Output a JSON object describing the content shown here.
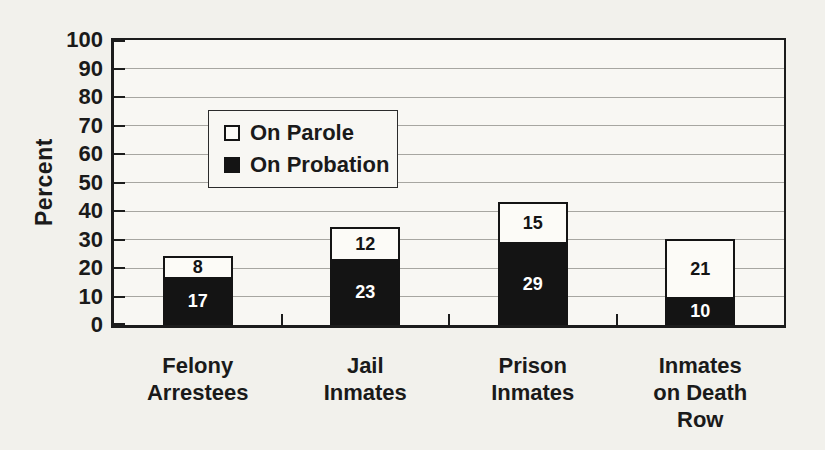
{
  "page": {
    "background": "#f2f1ec"
  },
  "chart_data": {
    "type": "bar",
    "stacked": true,
    "title": "",
    "xlabel": "",
    "ylabel": "Percent",
    "ylim": [
      0,
      100
    ],
    "yticks": [
      0,
      10,
      20,
      30,
      40,
      50,
      60,
      70,
      80,
      90,
      100
    ],
    "grid": true,
    "legend_position": "inside-upper-left",
    "categories": [
      "Felony Arrestees",
      "Jail Inmates",
      "Prison Inmates",
      "Inmates on Death Row"
    ],
    "category_label_lines": [
      [
        "Felony",
        "Arrestees"
      ],
      [
        "Jail",
        "Inmates"
      ],
      [
        "Prison",
        "Inmates"
      ],
      [
        "Inmates",
        "on Death",
        "Row"
      ]
    ],
    "stack_order_bottom_to_top": [
      "On Probation",
      "On Parole"
    ],
    "series": [
      {
        "name": "On Probation",
        "fill": "#141414",
        "label_color": "#ffffff",
        "values": [
          17,
          23,
          29,
          10
        ]
      },
      {
        "name": "On Parole",
        "fill": "#fcfbf7",
        "label_color": "#141414",
        "values": [
          8,
          12,
          15,
          21
        ]
      }
    ]
  },
  "legend": {
    "items": [
      {
        "label": "On Parole",
        "swatch": "white-square-icon"
      },
      {
        "label": "On Probation",
        "swatch": "black-square-icon"
      }
    ]
  },
  "colors": {
    "axis": "#1c1c1c",
    "grid": "#a7a6a1",
    "plot_background": "#f8f7f3",
    "page_background": "#f2f1ec",
    "bar_black": "#141414",
    "bar_white": "#fcfbf7",
    "text": "#1a1a1a"
  }
}
